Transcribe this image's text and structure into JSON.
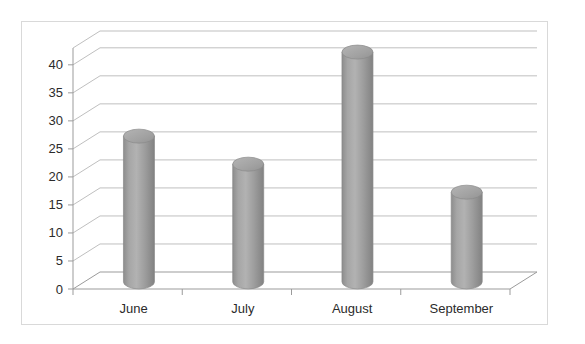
{
  "chart_data": {
    "type": "bar",
    "title": "",
    "subtitle": "",
    "xlabel": "",
    "ylabel": "",
    "categories": [
      "June",
      "July",
      "August",
      "September"
    ],
    "values": [
      26,
      21,
      41,
      16
    ],
    "series": [
      {
        "name": "Series 1",
        "values": [
          26,
          21,
          41,
          16
        ]
      }
    ],
    "ylim": [
      0,
      40
    ],
    "ytick_labels": [
      "0",
      "5",
      "10",
      "15",
      "20",
      "25",
      "30",
      "35",
      "40"
    ],
    "ytick_values": [
      0,
      5,
      10,
      15,
      20,
      25,
      30,
      35,
      40
    ],
    "grid": true,
    "grid_axis": "y",
    "legend": false,
    "legend_position": "none",
    "style": "3d-cylinder",
    "annotations": []
  },
  "colors": {
    "bar_fill": "#9a9a9a",
    "bar_fill_light": "#b9b9b9",
    "bar_fill_dark": "#7e7e7e",
    "bar_top": "#a8a8a8",
    "bar_outline": "#8a8a8a",
    "grid_line": "#bfbfbf",
    "axis_line": "#9b9b9b",
    "border": "#d9d9d9",
    "text": "#2b2b2b",
    "background": "#ffffff"
  },
  "chart_frame": {
    "border_label": "chart-border",
    "plot_area_label": "plot-area"
  }
}
